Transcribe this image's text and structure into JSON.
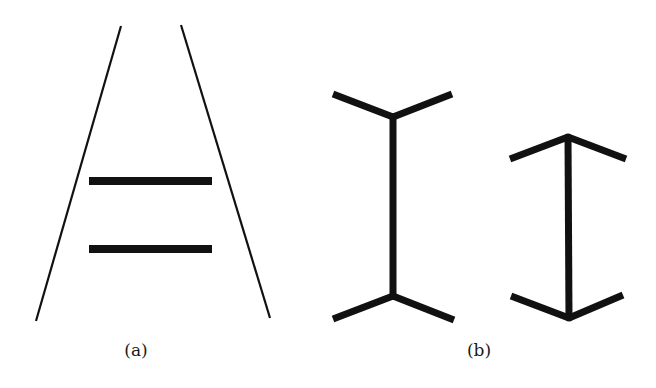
{
  "figure": {
    "width": 656,
    "height": 388,
    "background": "#ffffff",
    "stroke_color": "#111111",
    "panels": [
      {
        "id": "a",
        "label": "(a)",
        "illusion": "Ponzo illusion",
        "label_pos": [
          136,
          340
        ],
        "converging_lines": [
          {
            "x1": 121,
            "y1": 26,
            "x2": 36,
            "y2": 321,
            "width": 2.2
          },
          {
            "x1": 181,
            "y1": 25,
            "x2": 270,
            "y2": 318,
            "width": 2.2
          }
        ],
        "bars": [
          {
            "x1": 89,
            "y1": 181,
            "x2": 212,
            "y2": 181,
            "width": 8
          },
          {
            "x1": 89,
            "y1": 249,
            "x2": 212,
            "y2": 249,
            "width": 8
          }
        ]
      },
      {
        "id": "b",
        "label": "(b)",
        "illusion": "Müller-Lyer illusion",
        "label_pos": [
          479,
          340
        ],
        "figures": [
          {
            "name": "fins-out",
            "shaft": {
              "x1": 393,
              "y1": 117,
              "x2": 393,
              "y2": 296
            },
            "fins": [
              {
                "x1": 393,
                "y1": 117,
                "x2": 333,
                "y2": 94
              },
              {
                "x1": 393,
                "y1": 117,
                "x2": 452,
                "y2": 94
              },
              {
                "x1": 393,
                "y1": 296,
                "x2": 333,
                "y2": 319
              },
              {
                "x1": 393,
                "y1": 296,
                "x2": 454,
                "y2": 320
              }
            ],
            "width": 7
          },
          {
            "name": "fins-in",
            "shaft": {
              "x1": 568,
              "y1": 137,
              "x2": 569,
              "y2": 318
            },
            "fins": [
              {
                "x1": 568,
                "y1": 137,
                "x2": 510,
                "y2": 159
              },
              {
                "x1": 568,
                "y1": 137,
                "x2": 626,
                "y2": 159
              },
              {
                "x1": 569,
                "y1": 318,
                "x2": 511,
                "y2": 296
              },
              {
                "x1": 569,
                "y1": 318,
                "x2": 623,
                "y2": 295
              }
            ],
            "width": 7
          }
        ]
      }
    ]
  }
}
